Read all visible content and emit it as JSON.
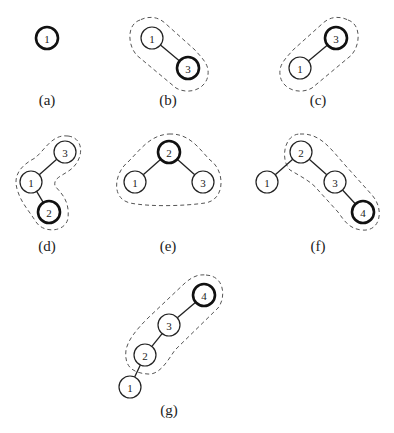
{
  "figure": {
    "panels": [
      {
        "id": "a",
        "caption": "(a)",
        "nodes": [
          {
            "label": "1",
            "x": 47,
            "y": 38,
            "bold": true
          }
        ],
        "edges": [],
        "blob": null
      },
      {
        "id": "b",
        "caption": "(b)",
        "nodes": [
          {
            "label": "1",
            "x": 152,
            "y": 38,
            "bold": false
          },
          {
            "label": "3",
            "x": 188,
            "y": 68,
            "bold": true
          }
        ],
        "edges": [
          [
            0,
            1
          ]
        ],
        "blob": "M140,20 C125,25 128,50 140,58 L176,88 C190,96 210,88 208,70 C207,62 200,56 195,50 L166,24 C158,16 148,16 140,20 Z"
      },
      {
        "id": "c",
        "caption": "(c)",
        "nodes": [
          {
            "label": "3",
            "x": 336,
            "y": 38,
            "bold": true
          },
          {
            "label": "1",
            "x": 300,
            "y": 68,
            "bold": false
          }
        ],
        "edges": [
          [
            0,
            1
          ]
        ],
        "blob": "M348,20 C363,25 360,50 348,58 L312,88 C298,96 278,88 280,70 C281,62 288,56 293,50 L322,24 C330,16 340,16 348,20 Z"
      },
      {
        "id": "d",
        "caption": "(d)",
        "nodes": [
          {
            "label": "3",
            "x": 65,
            "y": 152,
            "bold": false
          },
          {
            "label": "1",
            "x": 31,
            "y": 182,
            "bold": false
          },
          {
            "label": "2",
            "x": 49,
            "y": 212,
            "bold": true
          }
        ],
        "edges": [
          [
            0,
            1
          ],
          [
            1,
            2
          ]
        ],
        "blob": "M68,136 C85,138 84,160 70,170 C62,176 53,178 55,186 C60,192 70,200 68,218 C66,232 44,234 36,222 C30,212 22,204 18,192 C12,176 20,166 35,158 C45,150 52,134 68,136 Z"
      },
      {
        "id": "e",
        "caption": "(e)",
        "nodes": [
          {
            "label": "2",
            "x": 169,
            "y": 152,
            "bold": true
          },
          {
            "label": "1",
            "x": 135,
            "y": 182,
            "bold": false
          },
          {
            "label": "3",
            "x": 203,
            "y": 182,
            "bold": false
          }
        ],
        "edges": [
          [
            0,
            1
          ],
          [
            0,
            2
          ]
        ],
        "blob": "M169,134 C190,133 200,150 210,160 C225,170 226,200 205,203 C185,206 150,207 130,203 C110,198 115,172 128,162 C140,150 150,135 169,134 Z"
      },
      {
        "id": "f",
        "caption": "(f)",
        "nodes": [
          {
            "label": "2",
            "x": 301,
            "y": 152,
            "bold": false
          },
          {
            "label": "1",
            "x": 267,
            "y": 182,
            "bold": false
          },
          {
            "label": "3",
            "x": 335,
            "y": 182,
            "bold": false
          },
          {
            "label": "4",
            "x": 363,
            "y": 212,
            "bold": true
          }
        ],
        "edges": [
          [
            0,
            1
          ],
          [
            0,
            2
          ],
          [
            2,
            3
          ]
        ],
        "blob": "M300,134 C320,133 330,148 345,165 L372,195 C385,210 380,232 362,230 C350,229 345,222 338,212 L318,190 C312,182 300,176 290,170 C280,160 284,134 300,134 Z"
      },
      {
        "id": "g",
        "caption": "(g)",
        "nodes": [
          {
            "label": "4",
            "x": 204,
            "y": 295,
            "bold": true
          },
          {
            "label": "3",
            "x": 169,
            "y": 325,
            "bold": false
          },
          {
            "label": "2",
            "x": 145,
            "y": 355,
            "bold": false
          },
          {
            "label": "1",
            "x": 130,
            "y": 387,
            "bold": false
          }
        ],
        "edges": [
          [
            0,
            1
          ],
          [
            1,
            2
          ],
          [
            2,
            3
          ]
        ],
        "blob": "M206,275 C225,276 226,298 218,308 L175,350 C168,360 160,375 148,374 C132,373 124,366 126,350 C128,340 136,330 148,318 L185,283 C192,277 198,274 206,275 Z"
      }
    ]
  }
}
